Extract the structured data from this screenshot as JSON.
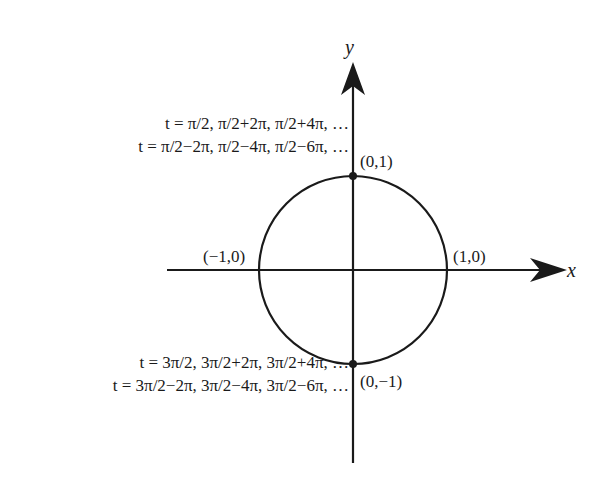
{
  "diagram": {
    "type": "unit-circle",
    "axes": {
      "x_label": "x",
      "y_label": "y"
    },
    "points": [
      {
        "id": "top",
        "label": "(0,1)"
      },
      {
        "id": "bottom",
        "label": "(0,−1)"
      },
      {
        "id": "left",
        "label": "(−1,0)"
      },
      {
        "id": "right",
        "label": "(1,0)"
      }
    ],
    "annotations": {
      "top_line1": "t = π/2, π/2+2π, π/2+4π, …",
      "top_line2": "t = π/2−2π, π/2−4π, π/2−6π, …",
      "bottom_line1": "t = 3π/2, 3π/2+2π, 3π/2+4π, …",
      "bottom_line2": "t = 3π/2−2π, 3π/2−4π, 3π/2−6π, …"
    },
    "colors": {
      "stroke": "#1a1a1a",
      "background": "#ffffff"
    }
  }
}
